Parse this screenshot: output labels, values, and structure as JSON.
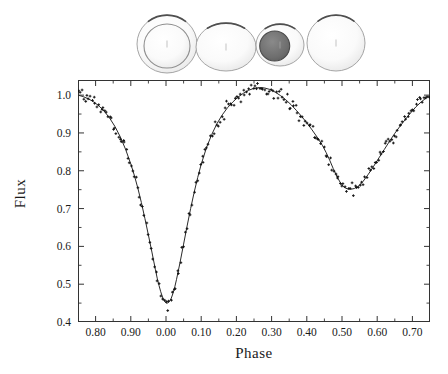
{
  "figure": {
    "background_color": "#ffffff",
    "ink_color": "#1a1a1a"
  },
  "star_models": {
    "caption_role": "eclipsing-binary-geometry-strip",
    "items": [
      {
        "name": "primary-eclipse-view",
        "label": "phase 0.00",
        "outer_rx": 30,
        "outer_ry": 29,
        "inner_rx": 23,
        "inner_ry": 22,
        "outer_fill": "#f7f7f7",
        "inner_fill": "#fbfbfb",
        "center_x": 167,
        "center_y": 44
      },
      {
        "name": "quadrature-view",
        "label": "phase 0.25",
        "outer_rx": 30,
        "outer_ry": 24,
        "inner_rx": 0,
        "inner_ry": 0,
        "outer_fill": "#fafafa",
        "inner_fill": "#fafafa",
        "center_x": 226,
        "center_y": 47
      },
      {
        "name": "secondary-eclipse-view",
        "label": "phase 0.50",
        "outer_rx": 24,
        "outer_ry": 21,
        "inner_rx": 15,
        "inner_ry": 15,
        "outer_fill": "#f2f2f2",
        "inner_fill": "#6f6f6f",
        "center_x": 280,
        "center_y": 45
      },
      {
        "name": "quadrature-view-2",
        "label": "phase 0.75",
        "outer_rx": 29,
        "outer_ry": 28,
        "inner_rx": 0,
        "inner_ry": 0,
        "outer_fill": "#fcfcfc",
        "inner_fill": "#fcfcfc",
        "center_x": 336,
        "center_y": 43
      }
    ]
  },
  "chart_data": {
    "type": "line",
    "title": "",
    "xlabel": "Phase",
    "ylabel": "Flux",
    "xlim": [
      0.75,
      1.75
    ],
    "ylim": [
      0.4,
      1.04
    ],
    "grid": false,
    "legend": null,
    "x_major_ticks": [
      0.8,
      0.9,
      1.0,
      1.1,
      1.2,
      1.3,
      1.4,
      1.5,
      1.6,
      1.7
    ],
    "x_tick_labels": [
      "0.80",
      "0.90",
      "0.00",
      "0.10",
      "0.20",
      "0.30",
      "0.40",
      "0.50",
      "0.60",
      "0.70"
    ],
    "x_minor_step": 0.05,
    "y_major_ticks": [
      0.4,
      0.5,
      0.6,
      0.7,
      0.8,
      0.9,
      1.0
    ],
    "y_tick_labels": [
      "0.4",
      "0.5",
      "0.6",
      "0.7",
      "0.8",
      "0.9",
      "1.0"
    ],
    "y_minor_step": 0.05,
    "series": [
      {
        "name": "model-fit-curve",
        "style": "solid-line",
        "color": "#2a2a2a",
        "x": [
          0.75,
          0.765,
          0.78,
          0.795,
          0.81,
          0.825,
          0.84,
          0.855,
          0.87,
          0.885,
          0.9,
          0.91,
          0.92,
          0.93,
          0.94,
          0.95,
          0.96,
          0.97,
          0.975,
          0.98,
          0.985,
          0.99,
          0.995,
          1.0,
          1.005,
          1.01,
          1.015,
          1.02,
          1.025,
          1.03,
          1.04,
          1.05,
          1.06,
          1.07,
          1.08,
          1.09,
          1.1,
          1.115,
          1.13,
          1.145,
          1.16,
          1.175,
          1.19,
          1.205,
          1.22,
          1.235,
          1.25,
          1.265,
          1.28,
          1.295,
          1.31,
          1.325,
          1.34,
          1.355,
          1.37,
          1.385,
          1.4,
          1.415,
          1.43,
          1.445,
          1.455,
          1.465,
          1.475,
          1.485,
          1.495,
          1.505,
          1.515,
          1.525,
          1.535,
          1.545,
          1.56,
          1.575,
          1.59,
          1.605,
          1.62,
          1.635,
          1.65,
          1.665,
          1.68,
          1.695,
          1.71,
          1.725,
          1.74,
          1.75
        ],
        "y": [
          1.0,
          0.996,
          0.99,
          0.982,
          0.971,
          0.957,
          0.939,
          0.917,
          0.89,
          0.857,
          0.818,
          0.788,
          0.754,
          0.716,
          0.674,
          0.63,
          0.585,
          0.538,
          0.516,
          0.497,
          0.48,
          0.466,
          0.456,
          0.45,
          0.45,
          0.455,
          0.463,
          0.476,
          0.493,
          0.513,
          0.558,
          0.606,
          0.654,
          0.7,
          0.743,
          0.782,
          0.817,
          0.861,
          0.896,
          0.925,
          0.948,
          0.967,
          0.982,
          0.995,
          1.005,
          1.013,
          1.018,
          1.02,
          1.019,
          1.015,
          1.008,
          0.999,
          0.988,
          0.975,
          0.96,
          0.944,
          0.927,
          0.908,
          0.888,
          0.866,
          0.848,
          0.828,
          0.806,
          0.786,
          0.769,
          0.757,
          0.752,
          0.751,
          0.753,
          0.758,
          0.772,
          0.791,
          0.812,
          0.834,
          0.856,
          0.878,
          0.899,
          0.918,
          0.936,
          0.953,
          0.969,
          0.982,
          0.993,
          1.0
        ]
      },
      {
        "name": "observed-photometry",
        "style": "scatter-points",
        "marker": "small-cross",
        "color": "#111111",
        "point_count": 214,
        "scatter_sigma": 0.012,
        "note": "observations scattered about the model fit"
      }
    ],
    "annotations": [
      {
        "name": "primary-minimum",
        "phase": 1.0,
        "flux": 0.45
      },
      {
        "name": "secondary-minimum",
        "phase": 1.505,
        "flux": 0.751
      },
      {
        "name": "maximum-I",
        "phase": 1.26,
        "flux": 1.02
      },
      {
        "name": "maximum-II",
        "phase": 1.75,
        "flux": 1.0
      }
    ]
  }
}
